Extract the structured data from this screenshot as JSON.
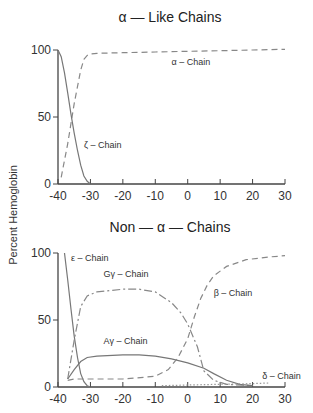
{
  "ylabel": "Percent Hemoglobin",
  "chart_data": [
    {
      "type": "line",
      "title": "α — Like Chains",
      "xlabel": "",
      "ylabel": "Percent Hemoglobin",
      "xlim": [
        -40,
        30
      ],
      "ylim": [
        0,
        100
      ],
      "xticks": [
        -40,
        -30,
        -20,
        -10,
        0,
        10,
        20,
        30
      ],
      "yticks": [
        0,
        50,
        100
      ],
      "grid": false,
      "series": [
        {
          "name": "α – Chain",
          "style": "dashed",
          "x": [
            -39,
            -37,
            -35,
            -33,
            -32,
            -31,
            -30,
            -28,
            -20,
            -10,
            0,
            10,
            20,
            30
          ],
          "y": [
            5,
            30,
            60,
            85,
            93,
            96,
            97,
            97.5,
            98,
            98.5,
            99,
            99.5,
            100,
            100.5
          ],
          "label_pos": [
            -5,
            89
          ]
        },
        {
          "name": "ζ – Chain",
          "style": "solid",
          "x": [
            -40,
            -39,
            -38,
            -37,
            -36,
            -35,
            -34,
            -33,
            -32,
            -31,
            -30
          ],
          "y": [
            100,
            95,
            83,
            68,
            52,
            38,
            25,
            14,
            6,
            2,
            0
          ],
          "label_pos": [
            -32,
            27
          ]
        }
      ]
    },
    {
      "type": "line",
      "title": "Non — α — Chains",
      "xlabel": "",
      "ylabel": "Percent Hemoglobin",
      "xlim": [
        -40,
        30
      ],
      "ylim": [
        0,
        100
      ],
      "xticks": [
        -40,
        -30,
        -20,
        -10,
        0,
        10,
        20,
        30
      ],
      "yticks": [
        0,
        50,
        100
      ],
      "grid": false,
      "series": [
        {
          "name": "ε – Chain",
          "style": "solid",
          "x": [
            -38,
            -37,
            -36,
            -35,
            -34,
            -33,
            -32,
            -31,
            -30
          ],
          "y": [
            100,
            80,
            58,
            38,
            22,
            10,
            4,
            1,
            0
          ],
          "label_pos": [
            -36,
            94
          ]
        },
        {
          "name": "Gγ – Chain",
          "style": "dashdot",
          "x": [
            -37,
            -35,
            -33,
            -31,
            -28,
            -20,
            -15,
            -10,
            -5,
            -2,
            0,
            3,
            5,
            8,
            12,
            20
          ],
          "y": [
            6,
            35,
            60,
            68,
            71,
            73,
            73,
            71,
            63,
            55,
            47,
            30,
            12,
            5,
            2,
            1
          ],
          "label_pos": [
            -26,
            82
          ]
        },
        {
          "name": "Aγ – Chain",
          "style": "solid",
          "x": [
            -37,
            -35,
            -33,
            -31,
            -28,
            -20,
            -15,
            -10,
            -5,
            0,
            5,
            8,
            12,
            16,
            20
          ],
          "y": [
            6,
            13,
            19,
            22,
            23,
            24,
            24,
            23,
            21,
            18,
            14,
            10,
            5,
            2,
            1
          ],
          "label_pos": [
            -26,
            32
          ]
        },
        {
          "name": "β – Chain",
          "style": "dashed",
          "x": [
            -37,
            -35,
            -30,
            -20,
            -10,
            -6,
            -3,
            0,
            2,
            4,
            6,
            8,
            12,
            18,
            25,
            30
          ],
          "y": [
            5,
            6,
            6,
            6,
            8,
            13,
            22,
            36,
            52,
            66,
            76,
            83,
            90,
            95,
            97,
            98
          ],
          "label_pos": [
            8,
            68
          ]
        },
        {
          "name": "δ – Chain",
          "style": "dotted",
          "x": [
            -8,
            0,
            10,
            20,
            25
          ],
          "y": [
            1,
            1.5,
            2,
            2.5,
            3
          ],
          "label_pos": [
            23,
            6
          ]
        }
      ]
    }
  ]
}
